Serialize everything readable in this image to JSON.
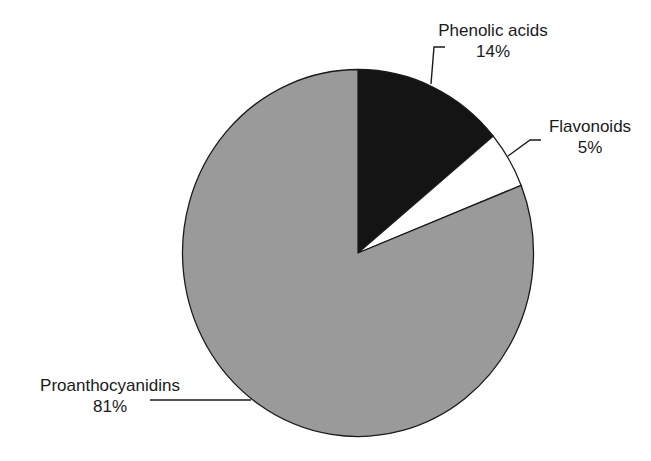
{
  "chart_data": {
    "type": "pie",
    "title": "",
    "start_angle_deg": 0,
    "direction": "clockwise",
    "slices": [
      {
        "label": "Phenolic acids",
        "value": 14,
        "value_label": "14%",
        "color": "#141414"
      },
      {
        "label": "Flavonoids",
        "value": 5,
        "value_label": "5%",
        "color": "#ffffff"
      },
      {
        "label": "Proanthocyanidins",
        "value": 81,
        "value_label": "81%",
        "color": "#9a9a9a"
      }
    ],
    "legend": "none (direct labels with leader lines)"
  },
  "labels": {
    "phenolic": {
      "name": "Phenolic acids",
      "pct": "14%"
    },
    "flavonoids": {
      "name": "Flavonoids",
      "pct": "5%"
    },
    "proantho": {
      "name": "Proanthocyanidins",
      "pct": "81%"
    }
  },
  "style": {
    "outline_color": "#1a1a1a",
    "leader_color": "#1a1a1a"
  }
}
